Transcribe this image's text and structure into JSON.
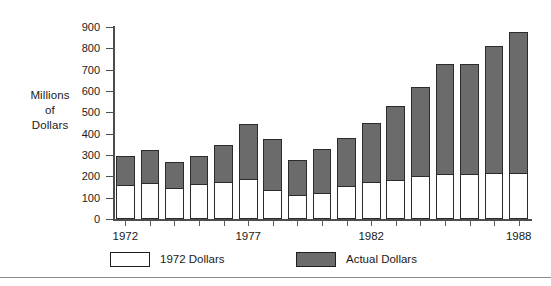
{
  "chart_data": {
    "type": "bar",
    "title": "",
    "subtitle": "",
    "xlabel": "",
    "ylabel": "Millions of Dollars",
    "ylabel_lines": [
      "Millions",
      "of",
      "Dollars"
    ],
    "ylim": [
      0,
      900
    ],
    "ytick_values": [
      0,
      100,
      200,
      300,
      400,
      500,
      600,
      700,
      800,
      900
    ],
    "ytick_labels": [
      "0",
      "100",
      "200",
      "300",
      "400",
      "500",
      "600",
      "700",
      "800",
      "900"
    ],
    "grid": false,
    "stacked": true,
    "legend_position": "bottom",
    "categories": [
      1972,
      1973,
      1974,
      1975,
      1976,
      1977,
      1978,
      1979,
      1980,
      1981,
      1982,
      1983,
      1984,
      1985,
      1986,
      1987,
      1988
    ],
    "xtick_labels": [
      "1972",
      "1977",
      "1982",
      "1988"
    ],
    "xtick_label_indices": [
      0,
      5,
      10,
      16
    ],
    "series": [
      {
        "name": "1972 Dollars",
        "color": "#ffffff",
        "values": [
          155,
          165,
          140,
          160,
          170,
          185,
          130,
          110,
          118,
          150,
          170,
          180,
          197,
          205,
          205,
          210,
          212
        ]
      },
      {
        "name": "Actual Dollars",
        "color": "#6b6b6b",
        "values": [
          295,
          322,
          268,
          295,
          345,
          447,
          377,
          278,
          328,
          382,
          450,
          532,
          617,
          727,
          727,
          810,
          876
        ]
      }
    ],
    "annotations": []
  },
  "legend": {
    "items": [
      {
        "label": "1972 Dollars",
        "swatch": "white"
      },
      {
        "label": "Actual Dollars",
        "swatch": "gray"
      }
    ]
  },
  "colors": {
    "bar_gray": "#6b6b6b",
    "bar_white": "#ffffff",
    "bar_outline": "#2b2b2b",
    "axis": "#4d4d4d",
    "text": "#1a1a1a",
    "background": "#ffffff",
    "footer_rule": "#8c8c8c"
  }
}
